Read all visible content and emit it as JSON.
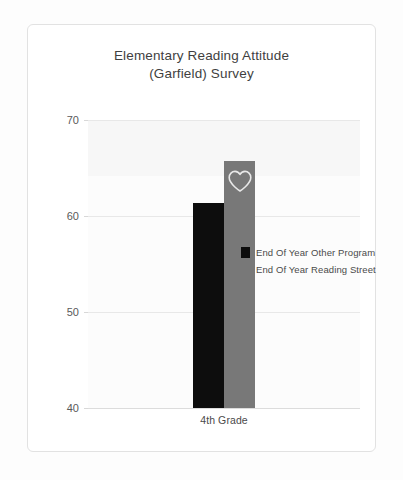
{
  "card": {
    "title_line_1": "Elementary Reading Attitude",
    "title_line_2": "(Garfield) Survey"
  },
  "chart_data": {
    "type": "bar",
    "title": "Elementary Reading Attitude (Garfield) Survey",
    "xlabel": "",
    "ylabel": "",
    "categories": [
      "4th Grade"
    ],
    "series": [
      {
        "name": "End Of Year Other Program",
        "color": "#0d0d0d",
        "values": [
          61.4
        ]
      },
      {
        "name": "End Of Year Reading Street",
        "color": "#787878",
        "values": [
          65.7
        ]
      }
    ],
    "ylim": [
      40,
      70
    ],
    "yticks": [
      40,
      50,
      60,
      70
    ],
    "ytick_labels": [
      "40",
      "50",
      "60",
      "70"
    ],
    "grid": true,
    "legend_position": "center-right",
    "annotations": [
      {
        "name": "heart-outline",
        "on_series": "End Of Year Reading Street",
        "category": "4th Grade"
      }
    ]
  }
}
